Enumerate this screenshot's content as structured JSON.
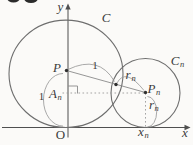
{
  "figure": {
    "axes": {
      "x_label": "x",
      "y_label": "y",
      "origin_label": "O"
    },
    "circles": {
      "large": {
        "label": "C"
      },
      "small": {
        "label": "C",
        "sub": "n"
      }
    },
    "points": {
      "center_large": {
        "label": "P"
      },
      "center_small": {
        "label": "P",
        "sub": "n"
      },
      "foot_on_y_axis": {
        "label": "A",
        "sub": "n"
      }
    },
    "lengths": {
      "p_to_origin": "1",
      "p_to_tangent": "1",
      "tangent_to_pn": {
        "label": "r",
        "sub": "n"
      },
      "pn_to_x_axis": {
        "label": "r",
        "sub": "n"
      },
      "x_coordinate": {
        "label": "x",
        "sub": "n"
      }
    }
  }
}
